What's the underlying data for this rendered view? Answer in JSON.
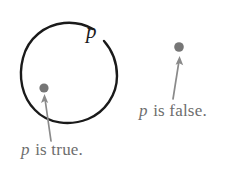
{
  "figure": {
    "name": "proposition-truth-set-diagram",
    "background_color": "#ffffff"
  },
  "set_region": {
    "label": "p",
    "shape": "circle",
    "stroke_color": "#1a1a1a",
    "center_x": 70,
    "center_y": 73,
    "radius": 48,
    "gap_at": "top-right"
  },
  "points": [
    {
      "id": "point-inside",
      "label_text_prefix": "p",
      "label_text_suffix": " is true.",
      "color": "#767676",
      "x": 44,
      "y": 88,
      "inside_region": "true"
    },
    {
      "id": "point-outside",
      "label_text_prefix": "p",
      "label_text_suffix": " is false.",
      "color": "#767676",
      "x": 179,
      "y": 47,
      "inside_region": "false"
    }
  ],
  "annotations": {
    "true_caption": {
      "variable": "p",
      "text": " is true.",
      "color": "#6d6d6d"
    },
    "false_caption": {
      "variable": "p",
      "text": " is false.",
      "color": "#6d6d6d"
    }
  },
  "arrows": {
    "color": "#8a8a8a",
    "left_arrow_name": "arrow-to-inside-point",
    "right_arrow_name": "arrow-to-outside-point"
  }
}
